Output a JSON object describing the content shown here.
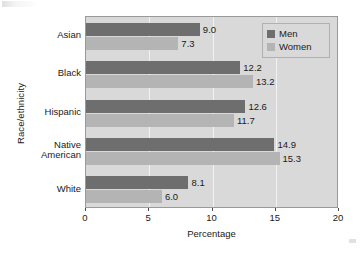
{
  "chart_data": {
    "type": "bar",
    "orientation": "horizontal",
    "title": "",
    "xlabel": "Percentage",
    "ylabel": "Race/ethnicity",
    "categories": [
      "Asian",
      "Black",
      "Hispanic",
      "Native\nAmerican",
      "White"
    ],
    "series": [
      {
        "name": "Men",
        "color": "#6e6e6e",
        "values": [
          9.0,
          12.2,
          12.6,
          14.9,
          8.1
        ]
      },
      {
        "name": "Women",
        "color": "#b4b4b4",
        "values": [
          7.3,
          13.2,
          11.7,
          15.3,
          6.0
        ]
      }
    ],
    "value_labels": [
      [
        "9.0",
        "7.3"
      ],
      [
        "12.2",
        "13.2"
      ],
      [
        "12.6",
        "11.7"
      ],
      [
        "14.9",
        "15.3"
      ],
      [
        "8.1",
        "6.0"
      ]
    ],
    "xlim": [
      0,
      20
    ],
    "xticks": [
      0,
      5,
      10,
      15,
      20
    ],
    "xtick_labels": [
      "0",
      "5",
      "10",
      "15",
      "20"
    ],
    "grid": true,
    "gridline_color": "#f2f2f2",
    "plot_background": "#d9d9d9",
    "legend_position": "top-right",
    "legend_entries": [
      "Men",
      "Women"
    ]
  }
}
